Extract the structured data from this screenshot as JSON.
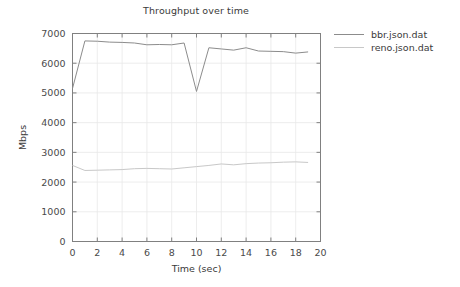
{
  "chart_data": {
    "type": "line",
    "title": "Throughput over time",
    "xlabel": "Time (sec)",
    "ylabel": "Mbps",
    "xlim": [
      0,
      20
    ],
    "ylim": [
      0,
      7000
    ],
    "xticks": [
      0,
      2,
      4,
      6,
      8,
      10,
      12,
      14,
      16,
      18,
      20
    ],
    "yticks": [
      0,
      1000,
      2000,
      3000,
      4000,
      5000,
      6000,
      7000
    ],
    "grid": true,
    "legend_position": "right",
    "series": [
      {
        "name": "bbr.json.dat",
        "color": "#8c8c8c",
        "x": [
          0,
          1,
          2,
          3,
          4,
          5,
          6,
          7,
          8,
          9,
          10,
          11,
          12,
          13,
          14,
          15,
          16,
          17,
          18,
          19
        ],
        "values": [
          5150,
          6750,
          6740,
          6710,
          6700,
          6680,
          6620,
          6630,
          6620,
          6680,
          5050,
          6520,
          6480,
          6440,
          6520,
          6410,
          6400,
          6390,
          6340,
          6380
        ]
      },
      {
        "name": "reno.json.dat",
        "color": "#c8c8c8",
        "x": [
          0,
          1,
          2,
          3,
          4,
          5,
          6,
          7,
          8,
          9,
          10,
          11,
          12,
          13,
          14,
          15,
          16,
          17,
          18,
          19
        ],
        "values": [
          2560,
          2390,
          2400,
          2410,
          2420,
          2450,
          2460,
          2450,
          2440,
          2480,
          2520,
          2560,
          2610,
          2580,
          2620,
          2640,
          2650,
          2670,
          2680,
          2660
        ]
      }
    ]
  },
  "legend": {
    "entries": [
      {
        "label": "bbr.json.dat",
        "color": "#8c8c8c"
      },
      {
        "label": "reno.json.dat",
        "color": "#c8c8c8"
      }
    ]
  },
  "axes": {
    "x_title": "Time (sec)",
    "y_title": "Mbps"
  },
  "style": {
    "background": "#ffffff",
    "axis_color": "#808080",
    "grid_color": "#e8e8e8",
    "text_color": "#3a3a3a"
  }
}
